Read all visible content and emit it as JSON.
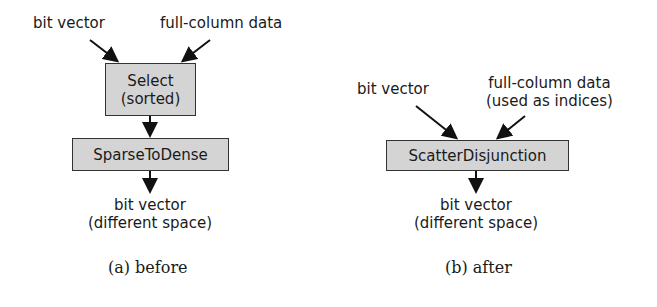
{
  "figure_a": {
    "inputs": {
      "left": "bit vector",
      "right": "full-column data"
    },
    "node1": {
      "line1": "Select",
      "line2": "(sorted)"
    },
    "node2": {
      "label": "SparseToDense"
    },
    "output": {
      "line1": "bit vector",
      "line2": "(different space)"
    },
    "caption": "(a)  before"
  },
  "figure_b": {
    "inputs": {
      "left": "bit vector",
      "right_line1": "full-column data",
      "right_line2": "(used as indices)"
    },
    "node1": {
      "label": "ScatterDisjunction"
    },
    "output": {
      "line1": "bit vector",
      "line2": "(different space)"
    },
    "caption": "(b)  after"
  },
  "colors": {
    "box_fill": "#d4d4d4",
    "box_border": "#333333",
    "arrow": "#111111"
  }
}
